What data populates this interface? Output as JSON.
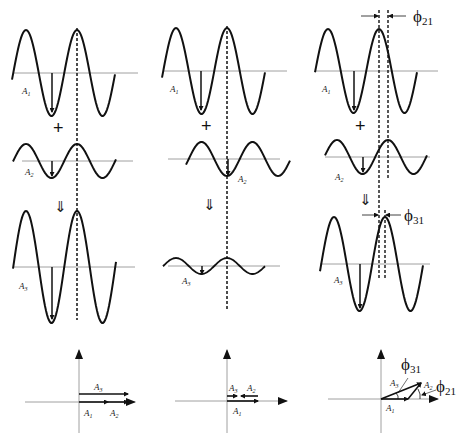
{
  "diagram": {
    "columns": [
      {
        "case": "in-phase",
        "waves": [
          {
            "label": "A",
            "sub": "1",
            "amplitude": "large"
          },
          {
            "label": "A",
            "sub": "2",
            "amplitude": "small"
          },
          {
            "label": "A",
            "sub": "3",
            "amplitude": "largest"
          }
        ],
        "operator": "+",
        "result_arrow": "⇓",
        "phasor": {
          "labels": [
            {
              "text": "A",
              "sub": "3"
            },
            {
              "text": "A",
              "sub": "1"
            },
            {
              "text": "A",
              "sub": "2"
            }
          ]
        }
      },
      {
        "case": "anti-phase",
        "waves": [
          {
            "label": "A",
            "sub": "1",
            "amplitude": "large"
          },
          {
            "label": "A",
            "sub": "2",
            "amplitude": "medium, inverted"
          },
          {
            "label": "A",
            "sub": "3",
            "amplitude": "small"
          }
        ],
        "operator": "+",
        "result_arrow": "⇓",
        "phasor": {
          "labels": [
            {
              "text": "A",
              "sub": "3"
            },
            {
              "text": "A",
              "sub": "2"
            },
            {
              "text": "A",
              "sub": "1"
            }
          ]
        }
      },
      {
        "case": "phase-shifted",
        "waves": [
          {
            "label": "A",
            "sub": "1",
            "amplitude": "large"
          },
          {
            "label": "A",
            "sub": "2",
            "amplitude": "medium, shifted"
          },
          {
            "label": "A",
            "sub": "3",
            "amplitude": "large, shifted"
          }
        ],
        "operator": "+",
        "result_arrow": "⇓",
        "phase_labels": [
          {
            "symbol": "ϕ",
            "sub": "21"
          },
          {
            "symbol": "ϕ",
            "sub": "31"
          }
        ],
        "phasor": {
          "labels": [
            {
              "text": "A",
              "sub": "3"
            },
            {
              "text": "A",
              "sub": "2"
            },
            {
              "text": "A",
              "sub": "1"
            }
          ],
          "angles": [
            {
              "symbol": "ϕ",
              "sub": "31"
            },
            {
              "symbol": "ϕ",
              "sub": "21"
            }
          ]
        }
      }
    ]
  }
}
